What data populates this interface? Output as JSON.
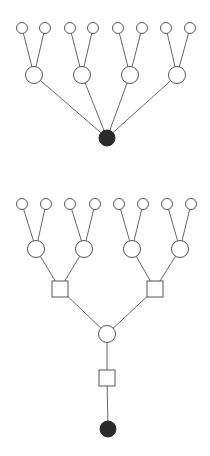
{
  "colors": {
    "background": "#ffffff",
    "stroke": "#555555",
    "filled": "#2b2b2b"
  },
  "diagrams": [
    {
      "name": "top-tree",
      "nodes": [
        {
          "id": "t_root",
          "shape": "circle",
          "filled": true,
          "x": 107,
          "y": 138,
          "r": 8
        },
        {
          "id": "t_m1",
          "shape": "circle",
          "filled": false,
          "x": 34,
          "y": 75,
          "r": 8.5
        },
        {
          "id": "t_m2",
          "shape": "circle",
          "filled": false,
          "x": 82,
          "y": 75,
          "r": 8.5
        },
        {
          "id": "t_m3",
          "shape": "circle",
          "filled": false,
          "x": 130,
          "y": 75,
          "r": 8.5
        },
        {
          "id": "t_m4",
          "shape": "circle",
          "filled": false,
          "x": 177,
          "y": 75,
          "r": 8.5
        },
        {
          "id": "t_l1",
          "shape": "circle",
          "filled": false,
          "x": 22,
          "y": 28,
          "r": 5.5
        },
        {
          "id": "t_l2",
          "shape": "circle",
          "filled": false,
          "x": 45,
          "y": 28,
          "r": 5.5
        },
        {
          "id": "t_l3",
          "shape": "circle",
          "filled": false,
          "x": 70,
          "y": 28,
          "r": 5.5
        },
        {
          "id": "t_l4",
          "shape": "circle",
          "filled": false,
          "x": 93,
          "y": 28,
          "r": 5.5
        },
        {
          "id": "t_l5",
          "shape": "circle",
          "filled": false,
          "x": 118,
          "y": 28,
          "r": 5.5
        },
        {
          "id": "t_l6",
          "shape": "circle",
          "filled": false,
          "x": 142,
          "y": 28,
          "r": 5.5
        },
        {
          "id": "t_l7",
          "shape": "circle",
          "filled": false,
          "x": 166,
          "y": 28,
          "r": 5.5
        },
        {
          "id": "t_l8",
          "shape": "circle",
          "filled": false,
          "x": 190,
          "y": 28,
          "r": 5.5
        }
      ],
      "edges": [
        [
          "t_root",
          "t_m1"
        ],
        [
          "t_root",
          "t_m2"
        ],
        [
          "t_root",
          "t_m3"
        ],
        [
          "t_root",
          "t_m4"
        ],
        [
          "t_m1",
          "t_l1"
        ],
        [
          "t_m1",
          "t_l2"
        ],
        [
          "t_m2",
          "t_l3"
        ],
        [
          "t_m2",
          "t_l4"
        ],
        [
          "t_m3",
          "t_l5"
        ],
        [
          "t_m3",
          "t_l6"
        ],
        [
          "t_m4",
          "t_l7"
        ],
        [
          "t_m4",
          "t_l8"
        ]
      ]
    },
    {
      "name": "bottom-tree",
      "nodes": [
        {
          "id": "b_root",
          "shape": "circle",
          "filled": true,
          "x": 108,
          "y": 429,
          "r": 8
        },
        {
          "id": "b_sq0",
          "shape": "square",
          "filled": false,
          "x": 107,
          "y": 378,
          "size": 16
        },
        {
          "id": "b_c0",
          "shape": "circle",
          "filled": false,
          "x": 107,
          "y": 334,
          "r": 8.5
        },
        {
          "id": "b_sq1",
          "shape": "square",
          "filled": false,
          "x": 60,
          "y": 289,
          "size": 16
        },
        {
          "id": "b_sq2",
          "shape": "square",
          "filled": false,
          "x": 155,
          "y": 289,
          "size": 16
        },
        {
          "id": "b_m1",
          "shape": "circle",
          "filled": false,
          "x": 36,
          "y": 249,
          "r": 8.5
        },
        {
          "id": "b_m2",
          "shape": "circle",
          "filled": false,
          "x": 84,
          "y": 249,
          "r": 8.5
        },
        {
          "id": "b_m3",
          "shape": "circle",
          "filled": false,
          "x": 132,
          "y": 249,
          "r": 8.5
        },
        {
          "id": "b_m4",
          "shape": "circle",
          "filled": false,
          "x": 180,
          "y": 249,
          "r": 8.5
        },
        {
          "id": "b_l1",
          "shape": "circle",
          "filled": false,
          "x": 22,
          "y": 204,
          "r": 5.5
        },
        {
          "id": "b_l2",
          "shape": "circle",
          "filled": false,
          "x": 46,
          "y": 204,
          "r": 5.5
        },
        {
          "id": "b_l3",
          "shape": "circle",
          "filled": false,
          "x": 70,
          "y": 204,
          "r": 5.5
        },
        {
          "id": "b_l4",
          "shape": "circle",
          "filled": false,
          "x": 95,
          "y": 204,
          "r": 5.5
        },
        {
          "id": "b_l5",
          "shape": "circle",
          "filled": false,
          "x": 119,
          "y": 204,
          "r": 5.5
        },
        {
          "id": "b_l6",
          "shape": "circle",
          "filled": false,
          "x": 143,
          "y": 204,
          "r": 5.5
        },
        {
          "id": "b_l7",
          "shape": "circle",
          "filled": false,
          "x": 167,
          "y": 204,
          "r": 5.5
        },
        {
          "id": "b_l8",
          "shape": "circle",
          "filled": false,
          "x": 191,
          "y": 204,
          "r": 5.5
        }
      ],
      "edges": [
        [
          "b_root",
          "b_sq0"
        ],
        [
          "b_sq0",
          "b_c0"
        ],
        [
          "b_c0",
          "b_sq1"
        ],
        [
          "b_c0",
          "b_sq2"
        ],
        [
          "b_sq1",
          "b_m1"
        ],
        [
          "b_sq1",
          "b_m2"
        ],
        [
          "b_sq2",
          "b_m3"
        ],
        [
          "b_sq2",
          "b_m4"
        ],
        [
          "b_m1",
          "b_l1"
        ],
        [
          "b_m1",
          "b_l2"
        ],
        [
          "b_m2",
          "b_l3"
        ],
        [
          "b_m2",
          "b_l4"
        ],
        [
          "b_m3",
          "b_l5"
        ],
        [
          "b_m3",
          "b_l6"
        ],
        [
          "b_m4",
          "b_l7"
        ],
        [
          "b_m4",
          "b_l8"
        ]
      ]
    }
  ]
}
